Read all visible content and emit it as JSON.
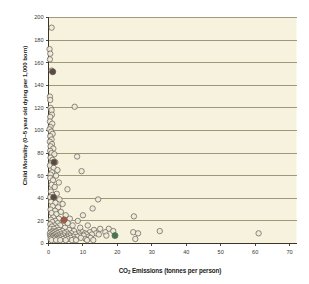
{
  "chart_data": {
    "type": "scatter",
    "title": "",
    "xlabel": "CO2 Emissions (tonnes per person)",
    "ylabel": "Child Mortality (0–5 year old dying per 1,000 born)",
    "xlabel_parts": {
      "pre": "CO",
      "sub": "2",
      "post": " Emissions (tonnes per person)"
    },
    "xlim": [
      0,
      72
    ],
    "ylim": [
      0,
      200
    ],
    "xticks": [
      0,
      10,
      20,
      30,
      40,
      50,
      60,
      70
    ],
    "yticks": [
      0,
      20,
      40,
      60,
      80,
      100,
      120,
      140,
      160,
      180,
      200
    ],
    "grid": "horizontal",
    "legend": "none",
    "colors": {
      "plot_background": "#f7f2dd",
      "gridline": "#8a7f63",
      "axis": "#3a3429",
      "marker_fill": "#efebdc",
      "marker_stroke": "#6b6456",
      "highlight_red": "#b0553a",
      "highlight_green": "#3f7a55",
      "highlight_dark": "#5a4a44",
      "page_background": "#ffffff"
    },
    "series": [
      {
        "name": "Countries",
        "marker": "open-circle",
        "points": [
          [
            0.9,
            191
          ],
          [
            0.3,
            172
          ],
          [
            0.5,
            168
          ],
          [
            0.4,
            163
          ],
          [
            0.9,
            153
          ],
          [
            1.3,
            152
          ],
          [
            0.4,
            130
          ],
          [
            0.5,
            127
          ],
          [
            7.6,
            121
          ],
          [
            0.6,
            120
          ],
          [
            0.9,
            118
          ],
          [
            1.0,
            114
          ],
          [
            0.5,
            112
          ],
          [
            0.4,
            108
          ],
          [
            1.1,
            106
          ],
          [
            0.6,
            103
          ],
          [
            0.3,
            101
          ],
          [
            0.8,
            99
          ],
          [
            1.2,
            97
          ],
          [
            0.5,
            95
          ],
          [
            0.9,
            92
          ],
          [
            0.4,
            90
          ],
          [
            1.0,
            88
          ],
          [
            0.6,
            86
          ],
          [
            1.4,
            84
          ],
          [
            0.5,
            82
          ],
          [
            0.9,
            80
          ],
          [
            1.7,
            79
          ],
          [
            8.3,
            77
          ],
          [
            0.6,
            76
          ],
          [
            1.2,
            74
          ],
          [
            2.0,
            72
          ],
          [
            0.8,
            71
          ],
          [
            0.4,
            69
          ],
          [
            1.5,
            67
          ],
          [
            2.6,
            65
          ],
          [
            9.6,
            64
          ],
          [
            1.0,
            63
          ],
          [
            0.6,
            61
          ],
          [
            2.2,
            60
          ],
          [
            0.5,
            58
          ],
          [
            1.3,
            56
          ],
          [
            3.0,
            54
          ],
          [
            0.9,
            52
          ],
          [
            1.8,
            50
          ],
          [
            5.5,
            48
          ],
          [
            0.7,
            46
          ],
          [
            2.4,
            44
          ],
          [
            1.1,
            43
          ],
          [
            0.5,
            41
          ],
          [
            1.6,
            40
          ],
          [
            3.2,
            39
          ],
          [
            14.4,
            39
          ],
          [
            0.8,
            37
          ],
          [
            2.0,
            36
          ],
          [
            4.1,
            35
          ],
          [
            1.2,
            33
          ],
          [
            2.8,
            32
          ],
          [
            12.8,
            31
          ],
          [
            0.6,
            30
          ],
          [
            1.9,
            29
          ],
          [
            3.6,
            28
          ],
          [
            0.9,
            27
          ],
          [
            2.3,
            26
          ],
          [
            5.0,
            25
          ],
          [
            10.0,
            25
          ],
          [
            24.8,
            24
          ],
          [
            1.4,
            23
          ],
          [
            3.0,
            22
          ],
          [
            6.2,
            22
          ],
          [
            0.7,
            21
          ],
          [
            2.0,
            20
          ],
          [
            4.4,
            20
          ],
          [
            8.5,
            20
          ],
          [
            1.1,
            19
          ],
          [
            2.7,
            18
          ],
          [
            5.6,
            18
          ],
          [
            0.5,
            17
          ],
          [
            1.8,
            16
          ],
          [
            3.4,
            16
          ],
          [
            7.0,
            16
          ],
          [
            11.4,
            16
          ],
          [
            1.0,
            15
          ],
          [
            2.4,
            14
          ],
          [
            4.8,
            14
          ],
          [
            9.2,
            14
          ],
          [
            0.6,
            13
          ],
          [
            1.6,
            13
          ],
          [
            3.0,
            12
          ],
          [
            6.0,
            12
          ],
          [
            13.2,
            12
          ],
          [
            15.0,
            13
          ],
          [
            17.5,
            13
          ],
          [
            1.2,
            11
          ],
          [
            2.2,
            11
          ],
          [
            4.0,
            11
          ],
          [
            7.4,
            11
          ],
          [
            0.8,
            10
          ],
          [
            1.9,
            10
          ],
          [
            3.3,
            10
          ],
          [
            5.2,
            10
          ],
          [
            9.8,
            10
          ],
          [
            12.0,
            10
          ],
          [
            16.5,
            10
          ],
          [
            18.8,
            11
          ],
          [
            24.6,
            10
          ],
          [
            26.0,
            9
          ],
          [
            32.3,
            11
          ],
          [
            61.0,
            9
          ],
          [
            0.4,
            9
          ],
          [
            1.4,
            9
          ],
          [
            2.6,
            9
          ],
          [
            4.6,
            9
          ],
          [
            6.6,
            9
          ],
          [
            8.8,
            9
          ],
          [
            10.6,
            9
          ],
          [
            13.8,
            9
          ],
          [
            0.9,
            8
          ],
          [
            2.0,
            8
          ],
          [
            3.6,
            8
          ],
          [
            5.8,
            8
          ],
          [
            7.8,
            8
          ],
          [
            11.0,
            8
          ],
          [
            12.6,
            8
          ],
          [
            14.6,
            8
          ],
          [
            0.5,
            7
          ],
          [
            1.6,
            7
          ],
          [
            3.0,
            7
          ],
          [
            4.4,
            7
          ],
          [
            6.2,
            7
          ],
          [
            9.0,
            7
          ],
          [
            10.2,
            7
          ],
          [
            16.8,
            7
          ],
          [
            0.7,
            6
          ],
          [
            1.2,
            6
          ],
          [
            2.4,
            6
          ],
          [
            3.8,
            6
          ],
          [
            5.4,
            6
          ],
          [
            7.2,
            6
          ],
          [
            8.4,
            6
          ],
          [
            11.6,
            6
          ],
          [
            25.2,
            4
          ],
          [
            1.0,
            5
          ],
          [
            2.0,
            5
          ],
          [
            3.2,
            5
          ],
          [
            4.8,
            5
          ],
          [
            6.4,
            5
          ],
          [
            9.4,
            5
          ],
          [
            12.2,
            5
          ],
          [
            0.6,
            4
          ],
          [
            1.8,
            4
          ],
          [
            2.8,
            4
          ],
          [
            4.2,
            4
          ],
          [
            5.6,
            4
          ],
          [
            7.6,
            4
          ],
          [
            10.8,
            4
          ],
          [
            0.9,
            3
          ],
          [
            2.2,
            3
          ],
          [
            3.4,
            3
          ],
          [
            5.0,
            3
          ],
          [
            6.8,
            3
          ],
          [
            8.0,
            3
          ],
          [
            11.2,
            3
          ],
          [
            13.0,
            3
          ]
        ]
      },
      {
        "name": "Highlighted (red)",
        "marker": "filled-circle",
        "color_key": "highlight_red",
        "points": [
          [
            4.5,
            21
          ]
        ]
      },
      {
        "name": "Highlighted (green)",
        "marker": "filled-circle",
        "color_key": "highlight_green",
        "points": [
          [
            19.3,
            7
          ]
        ]
      },
      {
        "name": "Highlighted (dark)",
        "marker": "filled-circle",
        "color_key": "highlight_dark",
        "points": [
          [
            1.6,
            72
          ],
          [
            1.2,
            152
          ],
          [
            1.5,
            41
          ]
        ]
      }
    ]
  }
}
